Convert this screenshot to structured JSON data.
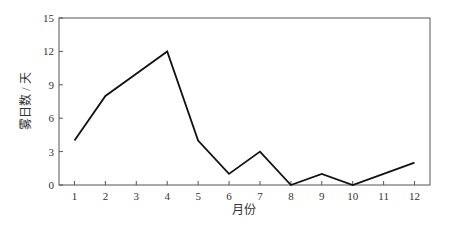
{
  "chart_data": {
    "type": "line",
    "title": "",
    "xlabel": "月份",
    "ylabel": "雾日数 / 天",
    "categories": [
      "1",
      "2",
      "3",
      "4",
      "5",
      "6",
      "7",
      "8",
      "9",
      "10",
      "11",
      "12"
    ],
    "x": [
      1,
      2,
      3,
      4,
      5,
      6,
      7,
      8,
      9,
      10,
      11,
      12
    ],
    "values": [
      4,
      8,
      10,
      12,
      4,
      1,
      3,
      0,
      1,
      0,
      1,
      2
    ],
    "yticks": [
      0,
      3,
      6,
      9,
      12,
      15
    ],
    "ylim": [
      0,
      15
    ],
    "xlim": [
      0.5,
      12.5
    ],
    "grid": false,
    "legend": null,
    "line_color": "#111111"
  }
}
